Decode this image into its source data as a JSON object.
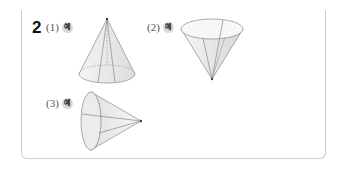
{
  "question": {
    "number": "2",
    "items": [
      {
        "label": "(1)",
        "badge": "예"
      },
      {
        "label": "(2)",
        "badge": "예"
      },
      {
        "label": "(3)",
        "badge": "예"
      }
    ]
  }
}
